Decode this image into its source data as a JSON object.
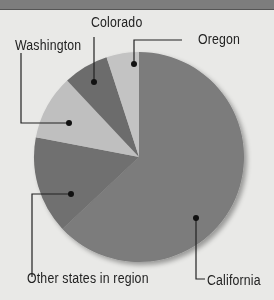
{
  "chart_data": {
    "type": "pie",
    "title": "",
    "title_note": "header text cut off at top of image",
    "start_angle_deg": 0,
    "direction": "clockwise",
    "slices": [
      {
        "label": "California",
        "value": 63,
        "color": "#7b7b7b"
      },
      {
        "label": "Other states in region",
        "value": 15,
        "color": "#6f6f6f"
      },
      {
        "label": "Washington",
        "value": 10,
        "color": "#bfbfbf"
      },
      {
        "label": "Colorado",
        "value": 7,
        "color": "#6c6c6c"
      },
      {
        "label": "Oregon",
        "value": 5,
        "color": "#c3c3c3"
      }
    ],
    "legend": "callout labels with leader lines"
  },
  "labels": {
    "california": "California",
    "other": "Other states in region",
    "washington": "Washington",
    "colorado": "Colorado",
    "oregon": "Oregon"
  },
  "colors": {
    "background": "#e9e9e7",
    "header": "#7d7d7d"
  }
}
